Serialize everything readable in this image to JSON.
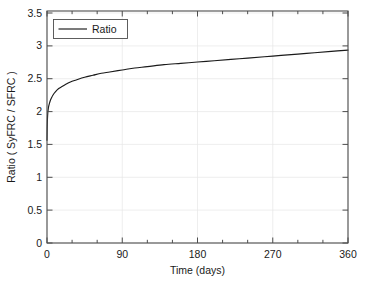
{
  "chart_data": {
    "type": "line",
    "title": "",
    "xlabel": "Time (days)",
    "ylabel": "Ratio ( SyFRC / SFRC )",
    "xlim": [
      0,
      360
    ],
    "ylim": [
      0,
      3.5
    ],
    "grid": true,
    "legend_position": "top-left",
    "x_ticks": [
      0,
      90,
      180,
      270,
      360
    ],
    "x_tick_labels": [
      "0",
      "90",
      "180",
      "270",
      "360"
    ],
    "x_minor_tick_step": 30,
    "y_ticks": [
      0,
      0.5,
      1,
      1.5,
      2,
      2.5,
      3,
      3.5
    ],
    "y_tick_labels": [
      "0",
      "0.5",
      "1",
      "1.5",
      "2",
      "2.5",
      "3",
      "3.5"
    ],
    "series": [
      {
        "name": "Ratio",
        "color": "#1a1a1a",
        "x": [
          0,
          0.2,
          0.5,
          1,
          1.5,
          2,
          3,
          4,
          5,
          7,
          10,
          14,
          18,
          22,
          28,
          35,
          45,
          55,
          65,
          75,
          90,
          105,
          120,
          140,
          160,
          180,
          200,
          220,
          240,
          260,
          280,
          300,
          320,
          340,
          360
        ],
        "y": [
          1.55,
          1.72,
          1.86,
          1.97,
          2.02,
          2.06,
          2.11,
          2.15,
          2.18,
          2.23,
          2.28,
          2.33,
          2.36,
          2.39,
          2.43,
          2.46,
          2.5,
          2.53,
          2.56,
          2.58,
          2.61,
          2.64,
          2.66,
          2.69,
          2.71,
          2.73,
          2.75,
          2.77,
          2.79,
          2.81,
          2.83,
          2.85,
          2.87,
          2.89,
          2.91
        ]
      }
    ],
    "legend_entries": [
      "Ratio"
    ]
  },
  "legend": {
    "entry_label": "Ratio"
  },
  "axes": {
    "x_title": "Time (days)",
    "y_title": "Ratio ( SyFRC / SFRC )",
    "x_tick_0": "0",
    "x_tick_1": "90",
    "x_tick_2": "180",
    "x_tick_3": "270",
    "x_tick_4": "360",
    "y_tick_0": "0",
    "y_tick_1": "0.5",
    "y_tick_2": "1",
    "y_tick_3": "1.5",
    "y_tick_4": "2",
    "y_tick_5": "2.5",
    "y_tick_6": "3",
    "y_tick_7": "3.5"
  },
  "colors": {
    "series": "#1a1a1a",
    "grid": "#e6e6e6",
    "axis": "#4d4d4d",
    "background": "#ffffff"
  }
}
